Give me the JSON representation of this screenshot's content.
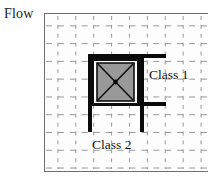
{
  "figure": {
    "axis_label": "Flow",
    "labels": {
      "class1": "Class 1",
      "class2": "Class 2"
    },
    "colors": {
      "element_fill": "#999999",
      "element_stroke": "#101010",
      "structure": "#0a0a0a",
      "grid": "#8c8c8c",
      "frame": "#6e6e6e",
      "background": "#ffffff",
      "text": "#101010"
    },
    "grid": {
      "style": "dashed",
      "spacing_px": 18,
      "columns": 9,
      "rows": 9
    },
    "element": {
      "name": "square-with-diagonals",
      "fill": "#999999",
      "has_center_node": true,
      "diagonals": 2
    },
    "structure": {
      "name": "flow-channel",
      "top_bar": {
        "x": 88,
        "y": 54,
        "w": 78,
        "h": 4
      },
      "bottom_bar": {
        "x": 88,
        "y": 102,
        "w": 78,
        "h": 4
      },
      "left_post": {
        "x": 88,
        "y": 54,
        "w": 4,
        "h": 78
      },
      "right_post": {
        "x": 140,
        "y": 54,
        "w": 4,
        "h": 78
      }
    }
  }
}
